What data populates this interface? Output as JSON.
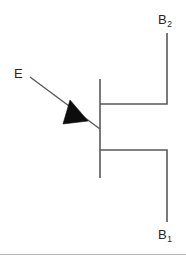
{
  "figure": {
    "background_color": "#ffffff",
    "line_color": "#595959",
    "fill_color": "#0d0d0d",
    "text_color": "#262626"
  },
  "labels": {
    "emitter": {
      "text": "E",
      "sub": ""
    },
    "base_two": {
      "text": "B",
      "sub": "2"
    },
    "base_one": {
      "text": "B",
      "sub": "1"
    }
  },
  "symbol": {
    "channel_bar": {
      "x": 100,
      "y1": 79,
      "y2": 178
    },
    "base2_lead": {
      "horizontal": {
        "x1": 100,
        "x2": 167,
        "y": 104
      },
      "vertical": {
        "x": 167,
        "y1": 33,
        "y2": 104
      }
    },
    "base1_lead": {
      "horizontal": {
        "x1": 100,
        "x2": 167,
        "y": 150
      },
      "vertical": {
        "x": 167,
        "y1": 150,
        "y2": 222
      }
    },
    "emitter_lead": {
      "x1": 30,
      "y1": 77,
      "x2": 100,
      "y2": 129
    },
    "emitter_arrow": {
      "points": "63,124 70,101 87,120",
      "direction": "toward-channel"
    }
  }
}
